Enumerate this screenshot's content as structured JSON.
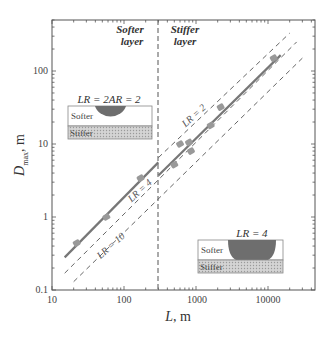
{
  "chart_data": {
    "type": "scatter",
    "title": "",
    "xlabel": "L, m",
    "ylabel": "D_max, m",
    "xscale": "log",
    "yscale": "log",
    "xlim": [
      10,
      40000
    ],
    "ylim": [
      0.1,
      500
    ],
    "x_ticks": [
      "10",
      "100",
      "1000",
      "10000"
    ],
    "y_ticks": [
      "0.1",
      "1",
      "10",
      "100"
    ],
    "grid": false,
    "divider_L": 300,
    "regions": [
      {
        "label_line1": "Softer",
        "label_line2": "layer"
      },
      {
        "label_line1": "Stiffer",
        "label_line2": "layer"
      }
    ],
    "series": [
      {
        "name": "Observed (softer layer)",
        "points": [
          [
            22,
            0.44
          ],
          [
            57,
            1.0
          ],
          [
            170,
            3.4
          ]
        ]
      },
      {
        "name": "Observed (stiffer layer)",
        "points": [
          [
            500,
            5.2
          ],
          [
            600,
            10
          ],
          [
            800,
            10.5
          ],
          [
            850,
            8
          ],
          [
            1600,
            18
          ],
          [
            2200,
            32
          ],
          [
            12000,
            150
          ]
        ]
      },
      {
        "name": "Fit (softer layer)",
        "style": "solid",
        "line": [
          [
            15,
            0.28
          ],
          [
            300,
            5.6
          ]
        ]
      },
      {
        "name": "Fit (stiffer layer)",
        "style": "solid",
        "line": [
          [
            300,
            3.7
          ],
          [
            15000,
            165
          ]
        ]
      },
      {
        "name": "LR = 2",
        "style": "dashed",
        "line": [
          [
            300,
            6.5
          ],
          [
            20000,
            330
          ]
        ]
      },
      {
        "name": "LR = 4",
        "style": "dashed",
        "line": [
          [
            15,
            0.17
          ],
          [
            25000,
            250
          ]
        ]
      },
      {
        "name": "LR = 10",
        "style": "dashed",
        "line": [
          [
            20,
            0.13
          ],
          [
            30000,
            150
          ]
        ]
      }
    ],
    "annotations": [
      "LR = 2",
      "LR = 4",
      "LR = 10",
      "LR = 2AR = 2",
      "LR = 4"
    ]
  },
  "axes": {
    "xlabel_main": "L",
    "xlabel_unit": ", m",
    "ylabel_main": "D",
    "ylabel_sub": "max",
    "ylabel_unit": ", m",
    "x_ticks": [
      {
        "label": "10",
        "x": 52
      },
      {
        "label": "100",
        "x": 124
      },
      {
        "label": "1000",
        "x": 197
      },
      {
        "label": "10000",
        "x": 268
      }
    ],
    "y_ticks": [
      {
        "label": "0.1",
        "y": 290
      },
      {
        "label": "1",
        "y": 217
      },
      {
        "label": "10",
        "y": 144
      },
      {
        "label": "100",
        "y": 71
      }
    ]
  },
  "regions": {
    "softer_line1": "Softer",
    "softer_line2": "layer",
    "stiffer_line1": "Stiffer",
    "stiffer_line2": "layer"
  },
  "line_labels": {
    "lr2": "LR = 2",
    "lr4": "LR = 4",
    "lr10": "LR = 10"
  },
  "insets": {
    "left": {
      "title": "LR = 2AR = 2",
      "top_label": "Softer",
      "bottom_label": "Stiffer"
    },
    "right": {
      "title": "LR = 4",
      "top_label": "Softer",
      "bottom_label": "Stiffer"
    }
  },
  "colors": {
    "fit_line": "#777777",
    "marker": "#999999",
    "dashed": "#555555",
    "dome": "#6e6e6e",
    "stiffer_fill": "#c8c8c8"
  }
}
